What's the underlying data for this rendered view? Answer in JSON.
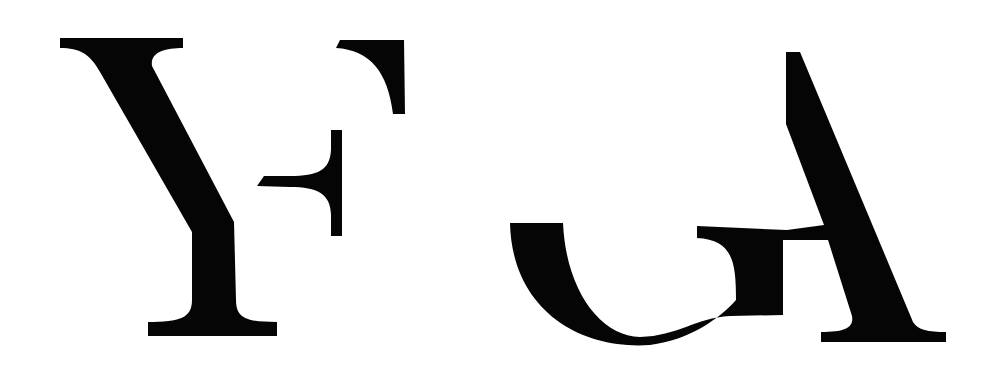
{
  "artwork": {
    "description": "Fragmented serif letterform logo",
    "letters": [
      "Y",
      "F",
      "G",
      "A"
    ],
    "groups": [
      {
        "name": "left-monogram",
        "letters": [
          "Y",
          "F"
        ]
      },
      {
        "name": "right-monogram",
        "letters": [
          "G",
          "A"
        ]
      }
    ],
    "colors": {
      "ink": "#050505",
      "background": "#ffffff"
    }
  }
}
